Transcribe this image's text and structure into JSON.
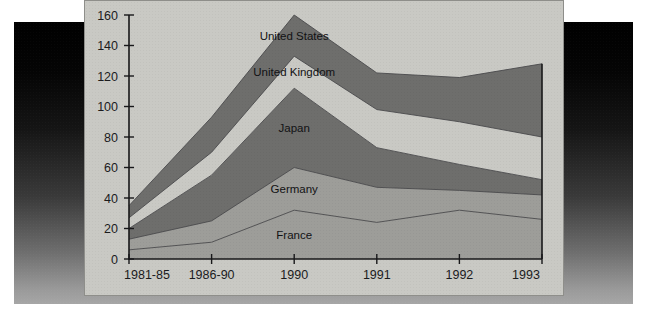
{
  "figure": {
    "background_color": "#000000",
    "card_color": "#c9c9c4",
    "axis_color": "#18181a"
  },
  "chart_data": {
    "type": "area",
    "stacked": true,
    "title": "",
    "subtitle": "",
    "xlabel": "",
    "ylabel": "",
    "grid": false,
    "legend_position": "inline-labels",
    "categories": [
      "1981-85",
      "1986-90",
      "1990",
      "1991",
      "1992",
      "1993"
    ],
    "x_tick_labels": [
      "1981-85",
      "1986-90",
      "1990",
      "1991",
      "1992",
      "1993"
    ],
    "y_tick_labels": [
      "0",
      "20",
      "40",
      "60",
      "80",
      "100",
      "120",
      "140",
      "160"
    ],
    "ylim": [
      0,
      160
    ],
    "y_tick_step": 20,
    "series": [
      {
        "name": "France",
        "color": "#9d9d99",
        "label_position_index": 2,
        "values": [
          6,
          11,
          32,
          24,
          32,
          26
        ],
        "cumulative": [
          6,
          11,
          32,
          24,
          32,
          26
        ]
      },
      {
        "name": "Germany",
        "color": "#9d9d99",
        "label_position_index": 2,
        "values": [
          7,
          14,
          28,
          23,
          13,
          16
        ],
        "cumulative": [
          13,
          25,
          60,
          47,
          45,
          42
        ]
      },
      {
        "name": "Japan",
        "color": "#6e6e6c",
        "label_position_index": 2,
        "values": [
          7,
          30,
          52,
          26,
          17,
          10
        ],
        "cumulative": [
          20,
          55,
          112,
          73,
          62,
          52
        ]
      },
      {
        "name": "United Kingdom",
        "color": "#c9c9c4",
        "label_position_index": 2,
        "values": [
          7,
          15,
          21,
          25,
          28,
          28
        ],
        "cumulative": [
          27,
          70,
          133,
          98,
          90,
          80
        ]
      },
      {
        "name": "United States",
        "color": "#6e6e6c",
        "label_position_index": 2,
        "values": [
          8,
          23,
          27,
          24,
          29,
          48
        ],
        "cumulative": [
          35,
          93,
          160,
          122,
          119,
          128
        ]
      }
    ]
  }
}
